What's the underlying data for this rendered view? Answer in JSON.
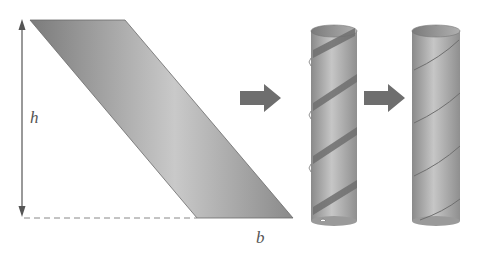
{
  "diagram": {
    "labels": {
      "height": "h",
      "base": "b"
    },
    "steps": [
      {
        "name": "flat-parallelogram-strip"
      },
      {
        "name": "strip-wrapping-cylinder"
      },
      {
        "name": "completed-tube"
      }
    ],
    "colors": {
      "strip_dark": "#7a7a7a",
      "strip_light": "#c4c4c4",
      "arrow": "#6e6e6e",
      "dimension_line": "#555555",
      "dashed_line": "#888888"
    }
  }
}
